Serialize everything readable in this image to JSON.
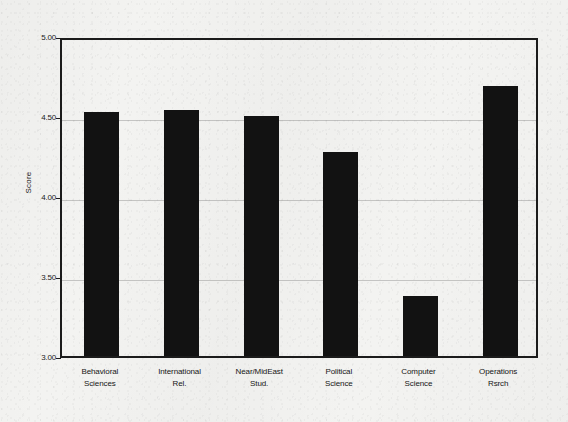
{
  "chart_data": {
    "type": "bar",
    "title": "",
    "xlabel": "",
    "ylabel": "Score",
    "ylim": [
      3.0,
      5.0
    ],
    "ytick_labels": [
      "5.00",
      "4.50",
      "4.00",
      "3.50",
      "3.00"
    ],
    "ytick_values": [
      5.0,
      4.5,
      4.0,
      3.5,
      3.0
    ],
    "grid": true,
    "legend": "none",
    "bar_color": "#121212",
    "categories": [
      "Behavioral Sciences",
      "International Rel.",
      "Near/MidEast Stud.",
      "Political Science",
      "Computer Science",
      "Operations Rsrch"
    ],
    "category_lines": [
      [
        "Behavioral",
        "Sciences"
      ],
      [
        "International",
        "Rel."
      ],
      [
        "Near/MidEast",
        "Stud."
      ],
      [
        "Political",
        "Science"
      ],
      [
        "Computer",
        "Science"
      ],
      [
        "Operations",
        "Rsrch"
      ]
    ],
    "values": [
      4.54,
      4.55,
      4.51,
      4.29,
      3.39,
      4.7
    ]
  },
  "axis": {
    "y_title": "Score",
    "ticks": [
      {
        "label": "5.00",
        "value": 5.0
      },
      {
        "label": "4.50",
        "value": 4.5
      },
      {
        "label": "4.00",
        "value": 4.0
      },
      {
        "label": "3.50",
        "value": 3.5
      },
      {
        "label": "3.00",
        "value": 3.0
      }
    ]
  },
  "bars": [
    {
      "line1": "Behavioral",
      "line2": "Sciences",
      "value": 4.54
    },
    {
      "line1": "International",
      "line2": "Rel.",
      "value": 4.55
    },
    {
      "line1": "Near/MidEast",
      "line2": "Stud.",
      "value": 4.51
    },
    {
      "line1": "Political",
      "line2": "Science",
      "value": 4.29
    },
    {
      "line1": "Computer",
      "line2": "Science",
      "value": 3.39
    },
    {
      "line1": "Operations",
      "line2": "Rsrch",
      "value": 4.7
    }
  ]
}
